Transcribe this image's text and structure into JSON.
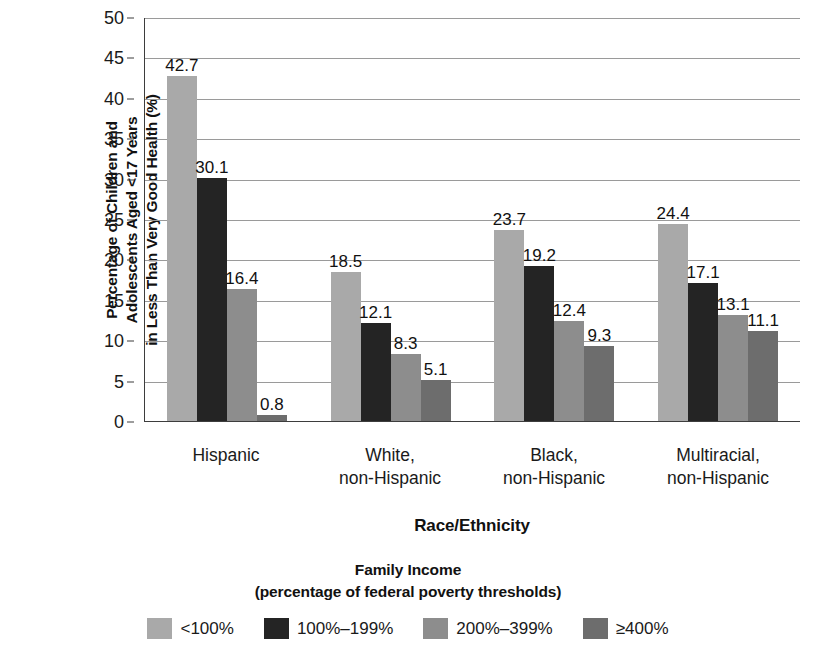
{
  "chart_data": {
    "type": "bar",
    "title": "",
    "xlabel": "Race/Ethnicity",
    "ylabel_lines": [
      "Percentage of Children and",
      "Adolescents Aged <17 Years",
      "in Less Than Very Good Health (%)"
    ],
    "ylabel": "Percentage of Children and Adolescents Aged <17 Years in Less Than Very Good Health (%)",
    "categories": [
      "Hispanic",
      "White, non-Hispanic",
      "Black, non-Hispanic",
      "Multiracial, non-Hispanic"
    ],
    "category_lines": [
      [
        "Hispanic"
      ],
      [
        "White,",
        "non-Hispanic"
      ],
      [
        "Black,",
        "non-Hispanic"
      ],
      [
        "Multiracial,",
        "non-Hispanic"
      ]
    ],
    "series": [
      {
        "name": "<100%",
        "color": "#a9a9a9",
        "values": [
          42.7,
          18.5,
          23.7,
          24.4
        ]
      },
      {
        "name": "100%–199%",
        "color": "#242424",
        "values": [
          30.1,
          12.1,
          19.2,
          17.1
        ]
      },
      {
        "name": "200%–399%",
        "color": "#8d8d8d",
        "values": [
          16.4,
          8.3,
          12.4,
          13.1
        ]
      },
      {
        "name": "≥400%",
        "color": "#6d6d6d",
        "values": [
          0.8,
          5.1,
          9.3,
          11.1
        ]
      }
    ],
    "value_labels": [
      [
        "42.7",
        "30.1",
        "16.4",
        "0.8"
      ],
      [
        "18.5",
        "12.1",
        "8.3",
        "5.1"
      ],
      [
        "23.7",
        "19.2",
        "12.4",
        "9.3"
      ],
      [
        "24.4",
        "17.1",
        "13.1",
        "11.1"
      ]
    ],
    "ylim": [
      0,
      50
    ],
    "yticks": [
      0,
      5,
      10,
      15,
      20,
      25,
      30,
      35,
      40,
      45,
      50
    ],
    "ytick_labels": [
      "0",
      "5",
      "10",
      "15",
      "20",
      "25",
      "30",
      "35",
      "40",
      "45",
      "50"
    ],
    "grid": true,
    "grid_axis": "y",
    "legend_position": "bottom",
    "legend_title_lines": [
      "Family Income",
      "(percentage of federal poverty thresholds)"
    ],
    "legend_title": "Family Income (percentage of federal poverty thresholds)"
  }
}
